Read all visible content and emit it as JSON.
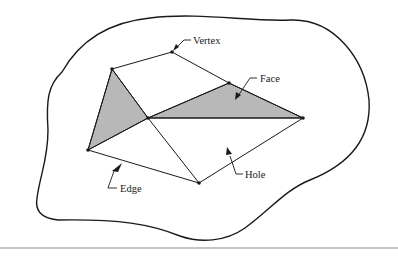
{
  "diagram": {
    "type": "polygon-mesh-topology",
    "labels": {
      "vertex": "Vertex",
      "face": "Face",
      "edge": "Edge",
      "hole": "Hole"
    },
    "colors": {
      "line": "#1a1a1a",
      "face_fill": "#b8b8b8",
      "background": "#ffffff",
      "separator": "#8a8a8a"
    },
    "vertices": [
      {
        "id": "A",
        "x": 112,
        "y": 69
      },
      {
        "id": "B",
        "x": 172,
        "y": 52
      },
      {
        "id": "C",
        "x": 229,
        "y": 83
      },
      {
        "id": "D",
        "x": 303,
        "y": 118
      },
      {
        "id": "E",
        "x": 148,
        "y": 118
      },
      {
        "id": "F",
        "x": 88,
        "y": 150
      },
      {
        "id": "G",
        "x": 199,
        "y": 183
      }
    ],
    "shaded_faces": [
      [
        "A",
        "E",
        "F"
      ],
      [
        "E",
        "C",
        "D"
      ]
    ],
    "edges": [
      [
        "A",
        "B"
      ],
      [
        "B",
        "C"
      ],
      [
        "C",
        "D"
      ],
      [
        "A",
        "E"
      ],
      [
        "E",
        "C"
      ],
      [
        "E",
        "D"
      ],
      [
        "A",
        "F"
      ],
      [
        "F",
        "E"
      ],
      [
        "F",
        "G"
      ],
      [
        "E",
        "G"
      ],
      [
        "G",
        "D"
      ]
    ]
  }
}
